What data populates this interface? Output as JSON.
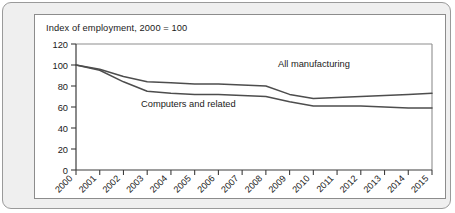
{
  "chart_data": {
    "type": "line",
    "title": "Index of employment, 2000 = 100",
    "xlabel": "",
    "ylabel": "",
    "ylim": [
      0,
      120
    ],
    "ytick_labels": [
      "0",
      "20",
      "40",
      "60",
      "80",
      "100",
      "120"
    ],
    "yticks": [
      0,
      20,
      40,
      60,
      80,
      100,
      120
    ],
    "grid": false,
    "legend": "inline-annotations",
    "categories": [
      "2000",
      "2001",
      "2002",
      "2003",
      "2004",
      "2005",
      "2006",
      "2007",
      "2008",
      "2009",
      "2010",
      "2011",
      "2012",
      "2013",
      "2014",
      "2015"
    ],
    "x": [
      2000,
      2001,
      2002,
      2003,
      2004,
      2005,
      2006,
      2007,
      2008,
      2009,
      2010,
      2011,
      2012,
      2013,
      2014,
      2015
    ],
    "series": [
      {
        "name": "All manufacturing",
        "label_text": "All manufacturing",
        "values": [
          100,
          96,
          89,
          84,
          83,
          82,
          82,
          81,
          80,
          72,
          68,
          69,
          70,
          71,
          72,
          73
        ]
      },
      {
        "name": "Computers and related",
        "label_text": "Computers and related",
        "values": [
          100,
          95,
          84,
          75,
          73,
          72,
          72,
          71,
          70,
          65,
          61,
          61,
          61,
          60,
          59,
          59
        ]
      }
    ],
    "annotations": [
      {
        "text": "All manufacturing",
        "x": 2008,
        "y": 88
      },
      {
        "text": "Computers and related",
        "x": 2003,
        "y": 55
      }
    ],
    "colors": {
      "line": "#4d4d4d",
      "axis": "#3c3c3c",
      "frame": "#8e8e8e",
      "panel_background": "#efefef",
      "card_background": "#ffffff",
      "text": "#1a1a1a"
    }
  }
}
